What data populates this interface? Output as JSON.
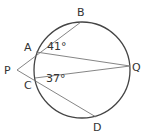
{
  "diagram": {
    "type": "circle-geometry",
    "colors": {
      "circle": "#444444",
      "lines": "#777777",
      "text": "#333333"
    },
    "circle": {
      "cx": 82,
      "cy": 70,
      "r": 48
    },
    "points": {
      "P": {
        "label": "P",
        "x": 17,
        "y": 70
      },
      "A": {
        "label": "A",
        "x": 36,
        "y": 52
      },
      "B": {
        "label": "B",
        "x": 81,
        "y": 22
      },
      "C": {
        "label": "C",
        "x": 35,
        "y": 78
      },
      "D": {
        "label": "D",
        "x": 96,
        "y": 117
      },
      "Q": {
        "label": "Q",
        "x": 130,
        "y": 66
      }
    },
    "segments": [
      "P-B",
      "P-D",
      "A-Q",
      "C-Q"
    ],
    "angles": [
      {
        "at": "A",
        "between": [
          "B",
          "Q"
        ],
        "label": "41°"
      },
      {
        "at": "C",
        "between": [
          "Q",
          "D"
        ],
        "label": "37°"
      }
    ]
  }
}
